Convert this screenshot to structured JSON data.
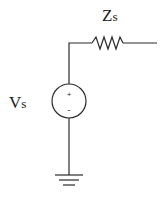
{
  "diagram": {
    "type": "circuit-schematic",
    "colors": {
      "stroke": "#2a2a2a",
      "text": "#1a1a1a",
      "background": "#ffffff"
    },
    "components": {
      "impedance": {
        "label_main": "Z",
        "label_sub": "s",
        "symbol": "resistor-zigzag"
      },
      "source": {
        "label_main": "V",
        "label_sub": "s",
        "symbol": "voltage-source",
        "plus_sign": "+",
        "minus_sign": "-"
      },
      "ground": {
        "symbol": "ground"
      }
    }
  }
}
